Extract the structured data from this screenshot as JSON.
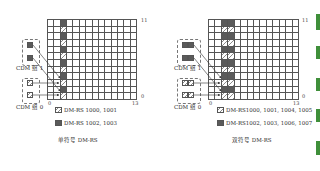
{
  "figure": {
    "grid": {
      "columns": 14,
      "rows": 12,
      "x_min_label": "0",
      "x_max_label": "13",
      "y_min_label": "0",
      "y_max_label": "11"
    },
    "colors": {
      "dark": "#5a5a5a",
      "hatch_line": "#888888",
      "grid_line": "#555555",
      "green_bar": "#3f8f3a"
    },
    "panels": [
      {
        "id": "single",
        "caption": "单符号 DM-RS",
        "colored_columns": [
          2
        ],
        "pattern": "odd rows dark, even rows hatched",
        "cdm_groups": [
          {
            "label": "CDM 组 1",
            "fill": "dark",
            "count": 2
          },
          {
            "label": "CDM 组 0",
            "fill": "hatch",
            "count": 2
          }
        ],
        "legend": [
          {
            "swatch": "hatch",
            "text": "DM-RS 1000, 1001"
          },
          {
            "swatch": "dark",
            "text": "DM-RS 1002, 1003"
          }
        ]
      },
      {
        "id": "double",
        "caption": "双符号 DM-RS",
        "colored_columns": [
          2,
          3
        ],
        "pattern": "odd rows dark, even rows hatched",
        "cdm_groups": [
          {
            "label": "CDM 组 1",
            "fill": "dark",
            "count": 2
          },
          {
            "label": "CDM 组 0",
            "fill": "hatch",
            "count": 2
          }
        ],
        "legend": [
          {
            "swatch": "hatch",
            "text": "DM-RS1000, 1001, 1004, 1005"
          },
          {
            "swatch": "dark",
            "text": "DM-RS1002, 1003, 1006, 1007"
          }
        ]
      }
    ],
    "green_bars": 5
  }
}
